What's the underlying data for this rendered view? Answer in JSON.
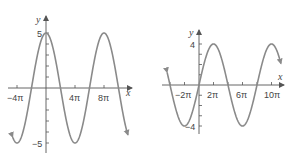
{
  "chart_data": [
    {
      "type": "line",
      "title": "",
      "function": "y = 5 cos(x/4)",
      "amplitude": 5,
      "period": "8π",
      "phase": "cos",
      "xlabel": "x",
      "ylabel": "y",
      "xticks": [
        "−4π",
        "4π",
        "8π"
      ],
      "xtick_values_pi": [
        -4,
        4,
        8
      ],
      "yticks": [
        "5",
        "−5"
      ],
      "ytick_values": [
        5,
        -5
      ],
      "xlim_pi": [
        -4.6,
        11.3
      ],
      "ylim": [
        -5,
        5
      ],
      "key_points": [
        {
          "x": "−4π",
          "y": -5
        },
        {
          "x": "−2π",
          "y": 0
        },
        {
          "x": "0",
          "y": 5
        },
        {
          "x": "2π",
          "y": 0
        },
        {
          "x": "4π",
          "y": -5
        },
        {
          "x": "6π",
          "y": 0
        },
        {
          "x": "8π",
          "y": 5
        },
        {
          "x": "10π",
          "y": 0
        }
      ],
      "grid": false
    },
    {
      "type": "line",
      "title": "",
      "function": "y = 4 sin(x/4)",
      "amplitude": 4,
      "period": "8π",
      "phase": "sin",
      "xlabel": "x",
      "ylabel": "y",
      "xticks": [
        "−2π",
        "2π",
        "6π",
        "10π"
      ],
      "xtick_values_pi": [
        -2,
        2,
        6,
        10
      ],
      "yticks": [
        "4",
        "−4"
      ],
      "ytick_values": [
        4,
        -4
      ],
      "xlim_pi": [
        -4.4,
        11.3
      ],
      "ylim": [
        -4,
        4
      ],
      "key_points": [
        {
          "x": "−4π",
          "y": 0
        },
        {
          "x": "−2π",
          "y": -4
        },
        {
          "x": "0",
          "y": 0
        },
        {
          "x": "2π",
          "y": 4
        },
        {
          "x": "4π",
          "y": 0
        },
        {
          "x": "6π",
          "y": -4
        },
        {
          "x": "8π",
          "y": 0
        },
        {
          "x": "10π",
          "y": 4
        }
      ],
      "grid": false
    }
  ],
  "left": {
    "y_label": "y",
    "x_label": "x",
    "y_top": "5",
    "y_bottom": "−5",
    "x_ticks": [
      "−4π",
      "4π",
      "8π"
    ]
  },
  "right": {
    "y_label": "y",
    "x_label": "x",
    "y_top": "4",
    "y_bottom": "−4",
    "x_ticks": [
      "−2π",
      "2π",
      "6π",
      "10π"
    ]
  }
}
